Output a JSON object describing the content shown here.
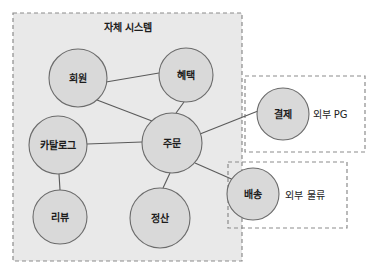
{
  "canvas": {
    "width": 375,
    "height": 275,
    "background": "#ffffff"
  },
  "colors": {
    "internal_boundary_fill": "#e9e9e9",
    "boundary_stroke": "#8c8c8c",
    "node_fill": "#d9d9d9",
    "node_stroke": "#6b6b6b",
    "edge_stroke": "#5a5a5a",
    "text": "#1c1c1c"
  },
  "groups": [
    {
      "id": "internal-system",
      "label": "자체 시스템",
      "label_position": "top-center",
      "filled": true,
      "x": 13,
      "y": 13,
      "width": 229,
      "height": 248,
      "label_x": 128,
      "label_y": 27
    },
    {
      "id": "external-pg",
      "label": "외부 PG",
      "label_position": "right-inside",
      "filled": false,
      "x": 245,
      "y": 76,
      "width": 120,
      "height": 76,
      "label_x": 330,
      "label_y": 114
    },
    {
      "id": "external-logistics",
      "label": "외부 물류",
      "label_position": "right-inside",
      "filled": false,
      "x": 228,
      "y": 162,
      "width": 119,
      "height": 66,
      "label_x": 305,
      "label_y": 195
    }
  ],
  "nodes": [
    {
      "id": "member",
      "label": "회원",
      "group": "internal-system",
      "cx": 78,
      "cy": 78,
      "r": 29
    },
    {
      "id": "benefit",
      "label": "혜택",
      "group": "internal-system",
      "cx": 186,
      "cy": 75,
      "r": 27
    },
    {
      "id": "order",
      "label": "주문",
      "group": "internal-system",
      "cx": 172,
      "cy": 143,
      "r": 30
    },
    {
      "id": "catalog",
      "label": "카탈로그",
      "group": "internal-system",
      "cx": 58,
      "cy": 145,
      "r": 29
    },
    {
      "id": "review",
      "label": "리뷰",
      "group": "internal-system",
      "cx": 60,
      "cy": 217,
      "r": 27
    },
    {
      "id": "settlement",
      "label": "정산",
      "group": "internal-system",
      "cx": 160,
      "cy": 218,
      "r": 30
    },
    {
      "id": "payment",
      "label": "결제",
      "group": "external-pg",
      "cx": 283,
      "cy": 114,
      "r": 26
    },
    {
      "id": "shipping",
      "label": "배송",
      "group": "external-logistics",
      "cx": 253,
      "cy": 194,
      "r": 26
    }
  ],
  "edges": [
    {
      "id": "member-benefit",
      "from": "member",
      "to": "benefit",
      "x1": 106,
      "y1": 82,
      "x2": 159,
      "y2": 73
    },
    {
      "id": "member-order",
      "from": "member",
      "to": "order",
      "x1": 97,
      "y1": 100,
      "x2": 152,
      "y2": 121
    },
    {
      "id": "benefit-order",
      "from": "benefit",
      "to": "order",
      "x1": 184,
      "y1": 102,
      "x2": 176,
      "y2": 113
    },
    {
      "id": "catalog-order",
      "from": "catalog",
      "to": "order",
      "x1": 87,
      "y1": 144,
      "x2": 142,
      "y2": 142
    },
    {
      "id": "catalog-review",
      "from": "catalog",
      "to": "review",
      "x1": 59,
      "y1": 174,
      "x2": 60,
      "y2": 190
    },
    {
      "id": "order-settlement",
      "from": "order",
      "to": "settlement",
      "x1": 170,
      "y1": 173,
      "x2": 163,
      "y2": 188
    },
    {
      "id": "order-shipping",
      "from": "order",
      "to": "shipping",
      "x1": 195,
      "y1": 163,
      "x2": 236,
      "y2": 181
    },
    {
      "id": "order-payment",
      "from": "order",
      "to": "payment",
      "x1": 200,
      "y1": 134,
      "x2": 258,
      "y2": 111
    }
  ]
}
